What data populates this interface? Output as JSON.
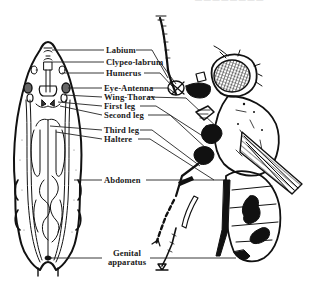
{
  "figure": {
    "top_cut_text": "— — — — — — — —",
    "labels": [
      {
        "id": "labium",
        "text": "Labium",
        "x": 106,
        "y": 47
      },
      {
        "id": "clypeo-labrum",
        "text": "Clypeo-labrum",
        "x": 106,
        "y": 59
      },
      {
        "id": "humerus",
        "text": "Humerus",
        "x": 106,
        "y": 70
      },
      {
        "id": "eye-antenna",
        "text": "Eye-Antenna",
        "x": 104,
        "y": 86
      },
      {
        "id": "wing-thorax",
        "text": "Wing-Thorax",
        "x": 104,
        "y": 95
      },
      {
        "id": "first-leg",
        "text": "First leg",
        "x": 104,
        "y": 104
      },
      {
        "id": "second-leg",
        "text": "Second leg",
        "x": 104,
        "y": 113
      },
      {
        "id": "third-leg",
        "text": "Third leg",
        "x": 104,
        "y": 128
      },
      {
        "id": "haltere",
        "text": "Haltere",
        "x": 104,
        "y": 137
      },
      {
        "id": "abdomen",
        "text": "Abdomen",
        "x": 104,
        "y": 178
      },
      {
        "id": "genital-apparatus",
        "text": "Genital\napparatus",
        "x": 104,
        "y": 253
      }
    ]
  }
}
